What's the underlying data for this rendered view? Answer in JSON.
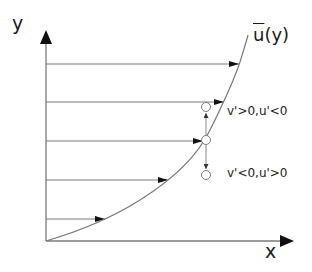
{
  "diagram": {
    "axes": {
      "x_label": "x",
      "y_label": "y"
    },
    "curve_label": {
      "base": "u",
      "overbar": true,
      "suffix": "(y)"
    },
    "annotations": [
      {
        "text": "v'>0,u'<0"
      },
      {
        "text": "v'<0,u'>0"
      }
    ],
    "velocity_arrows": [
      {
        "y": 64,
        "tip_x": 239
      },
      {
        "y": 102,
        "tip_x": 224
      },
      {
        "y": 141,
        "tip_x": 204
      },
      {
        "y": 180,
        "tip_x": 168
      },
      {
        "y": 219,
        "tip_x": 105
      }
    ],
    "fluid_particles": [
      {
        "name": "upper",
        "cx": 206,
        "cy": 107
      },
      {
        "name": "middle",
        "cx": 206,
        "cy": 140
      },
      {
        "name": "lower",
        "cx": 206,
        "cy": 175
      }
    ],
    "colors": {
      "line": "#7a7a7a",
      "arrowhead": "#111111",
      "text": "#1a1a1a"
    }
  }
}
